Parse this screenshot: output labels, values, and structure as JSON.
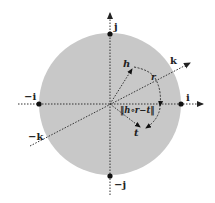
{
  "diagram": {
    "title": "",
    "colors": {
      "disk_fill": "#c8c8c8",
      "axis": "#333333",
      "point": "#111111",
      "label": "#222222"
    },
    "axes": {
      "pos_i": "i",
      "neg_i": "−i",
      "pos_j": "j",
      "neg_j": "−j",
      "pos_k": "k",
      "neg_k": "−k"
    },
    "vectors": {
      "h": "h",
      "r": "r",
      "t": "t"
    },
    "annotation": "‖h∘r−t‖"
  }
}
